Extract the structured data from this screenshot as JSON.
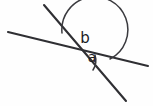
{
  "figure": {
    "type": "geometry-diagram",
    "background_color": "#fefefe",
    "line_color": "#2f2f33",
    "arc_color": "#3a3a3e",
    "label_color": "#1b1b1e",
    "width": 153,
    "height": 106,
    "intersection": {
      "x": 77,
      "y": 52
    },
    "lines": [
      {
        "name": "shallow-line",
        "x1": 8,
        "y1": 32,
        "x2": 148,
        "y2": 66
      },
      {
        "name": "steep-line",
        "x1": 44,
        "y1": 5,
        "x2": 126,
        "y2": 101
      }
    ],
    "arcs": [
      {
        "name": "angle-b-arc",
        "label": "b",
        "radius": 33,
        "start": {
          "x": 62,
          "y": 33
        },
        "end": {
          "x": 110,
          "y": 59
        },
        "sweep": 1,
        "large_arc": 1
      },
      {
        "name": "angle-a-arc",
        "label": "a",
        "radius": 18,
        "start": {
          "x": 94,
          "y": 56
        },
        "end": {
          "x": 94,
          "y": 69
        },
        "sweep": 1,
        "large_arc": 0
      }
    ],
    "labels": [
      {
        "name": "angle-label-b",
        "text": "b",
        "x": 85,
        "y": 38,
        "font_size": 15
      },
      {
        "name": "angle-label-a",
        "text": "a",
        "x": 92,
        "y": 58,
        "font_size": 14
      }
    ]
  }
}
